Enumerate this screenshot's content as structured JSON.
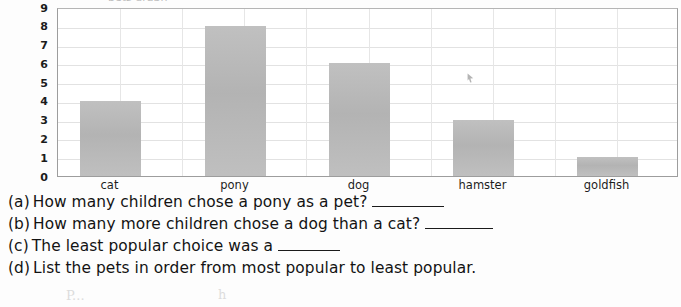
{
  "chart_data": {
    "type": "bar",
    "title": "",
    "title_cropped_remnant": "pets graph",
    "xlabel": "",
    "ylabel": "",
    "categories": [
      "cat",
      "pony",
      "dog",
      "hamster",
      "goldfish"
    ],
    "values": [
      4,
      8,
      6,
      3,
      1
    ],
    "series": [
      {
        "name": "children",
        "values": [
          4,
          8,
          6,
          3,
          1
        ]
      }
    ],
    "ylim": [
      0,
      9
    ],
    "yticks": [
      "0",
      "1",
      "2",
      "3",
      "4",
      "5",
      "6",
      "7",
      "8",
      "9"
    ],
    "grid": true,
    "legend": false,
    "legend_position": "none",
    "bar_color": "#b9b9b9",
    "axis_color": "#9d9d9d",
    "grid_color": "#e2e2e2",
    "text_color": "#1b1b1b"
  },
  "questions": [
    {
      "label": "(a)",
      "text": "How many children chose a pony as a pet?",
      "blank": true,
      "blank_width": 72,
      "trailing": ""
    },
    {
      "label": "(b)",
      "text": "How many more children chose a dog than a cat?",
      "blank": true,
      "blank_width": 68,
      "trailing": ""
    },
    {
      "label": "(c)",
      "text": "The least popular choice was a",
      "blank": true,
      "blank_width": 62,
      "trailing": ""
    },
    {
      "label": "(d)",
      "text": "List the pets in order from most popular to least popular.",
      "blank": false,
      "blank_width": 0,
      "trailing": ""
    }
  ],
  "artifacts": {
    "pointer_mark": "cursor-arrow",
    "pencil_marks": [
      "P...",
      "h"
    ]
  }
}
